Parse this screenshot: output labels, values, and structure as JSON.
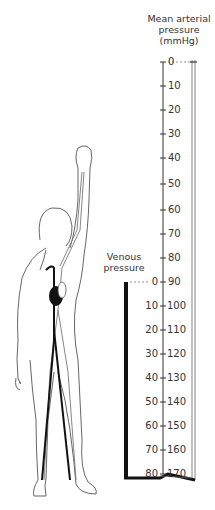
{
  "labels": {
    "arterial_title_1": "Mean arterial",
    "arterial_title_2": "pressure",
    "arterial_title_3": "(mmHg)",
    "venous_title_1": "Venous",
    "venous_title_2": "pressure"
  },
  "arterial_scale": [
    "0",
    "10",
    "20",
    "30",
    "40",
    "50",
    "60",
    "70",
    "80",
    "90",
    "100",
    "110",
    "120",
    "130",
    "140",
    "150",
    "160",
    "170"
  ],
  "venous_scale": [
    "0",
    "10",
    "20",
    "30",
    "40",
    "50",
    "60",
    "70",
    "80"
  ],
  "colors": {
    "line": "#333333",
    "blood_vein": "#111111",
    "text": "#333333"
  }
}
